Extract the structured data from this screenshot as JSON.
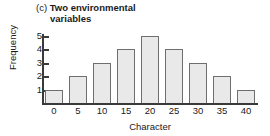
{
  "figure": {
    "panel_letter": "(c)",
    "title_line1": "Two environmental",
    "title_line2": "variables"
  },
  "chart_data": {
    "type": "bar",
    "title": "(c) Two environmental variables",
    "xlabel": "Character",
    "ylabel": "Frequency",
    "categories": [
      "0",
      "5",
      "10",
      "15",
      "20",
      "25",
      "30",
      "35",
      "40"
    ],
    "values": [
      1,
      2,
      3,
      4,
      5,
      4,
      3,
      2,
      1
    ],
    "x": [
      0,
      5,
      10,
      15,
      20,
      25,
      30,
      35,
      40
    ],
    "ylim": [
      0,
      5
    ],
    "xlim": [
      0,
      40
    ],
    "y_ticks": [
      1,
      2,
      3,
      4,
      5
    ],
    "y_tick_labels": [
      "1",
      "2",
      "3",
      "4",
      "5"
    ],
    "x_tick_labels": [
      "0",
      "5",
      "10",
      "15",
      "20",
      "25",
      "30",
      "35",
      "40"
    ],
    "grid": false,
    "legend": null,
    "bar_fill_color": "#e9e9e9",
    "bar_edge_color": "#6e6e6e",
    "axis_color": "#3a3a3a",
    "background_color": "#ffffff"
  }
}
